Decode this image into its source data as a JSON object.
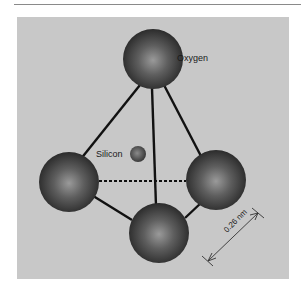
{
  "figure": {
    "type": "silicon-oxygen tetrahedron",
    "labels": {
      "oxygen": "Oxygen",
      "silicon": "Silicon",
      "distance": "0.26 nm"
    },
    "colors": {
      "background_panel": "#c8c8c8",
      "bond_line": "#111111",
      "sphere_dark": "#2a2a2a",
      "sphere_light": "#8f8f8f",
      "dimension_line": "#333333"
    }
  }
}
